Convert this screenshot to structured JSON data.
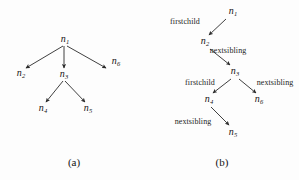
{
  "figure": {
    "background_color": "#fdfdfd",
    "stroke_color": "#2a2a2a",
    "text_color": "#141414"
  },
  "panel_a": {
    "caption": "(a)",
    "caption_pos": {
      "x": 74,
      "y": 162
    },
    "nodes": [
      {
        "id": "a-n1",
        "name": "n",
        "sub": "1",
        "x": 65,
        "y": 40
      },
      {
        "id": "a-n2",
        "name": "n",
        "sub": "2",
        "x": 21,
        "y": 74
      },
      {
        "id": "a-n3",
        "name": "n",
        "sub": "3",
        "x": 64,
        "y": 75
      },
      {
        "id": "a-n6",
        "name": "n",
        "sub": "6",
        "x": 116,
        "y": 62
      },
      {
        "id": "a-n4",
        "name": "n",
        "sub": "4",
        "x": 43,
        "y": 109
      },
      {
        "id": "a-n5",
        "name": "n",
        "sub": "5",
        "x": 88,
        "y": 109
      }
    ],
    "edges": [
      {
        "id": "a-e1",
        "from": "a-n1",
        "to": "a-n2",
        "x1": 63,
        "y1": 46,
        "x2": 26,
        "y2": 68
      },
      {
        "id": "a-e2",
        "from": "a-n1",
        "to": "a-n3",
        "x1": 64,
        "y1": 46,
        "x2": 64,
        "y2": 68
      },
      {
        "id": "a-e3",
        "from": "a-n1",
        "to": "a-n6",
        "x1": 67,
        "y1": 46,
        "x2": 106,
        "y2": 68
      },
      {
        "id": "a-e4",
        "from": "a-n3",
        "to": "a-n4",
        "x1": 63,
        "y1": 81,
        "x2": 46,
        "y2": 102
      },
      {
        "id": "a-e5",
        "from": "a-n3",
        "to": "a-n5",
        "x1": 65,
        "y1": 81,
        "x2": 85,
        "y2": 102
      }
    ]
  },
  "panel_b": {
    "caption": "(b)",
    "caption_pos": {
      "x": 222,
      "y": 162
    },
    "nodes": [
      {
        "id": "b-n1",
        "name": "n",
        "sub": "1",
        "x": 233,
        "y": 12
      },
      {
        "id": "b-n2",
        "name": "n",
        "sub": "2",
        "x": 205,
        "y": 42
      },
      {
        "id": "b-n3",
        "name": "n",
        "sub": "3",
        "x": 235,
        "y": 72
      },
      {
        "id": "b-n4",
        "name": "n",
        "sub": "4",
        "x": 209,
        "y": 100
      },
      {
        "id": "b-n6",
        "name": "n",
        "sub": "6",
        "x": 259,
        "y": 100
      },
      {
        "id": "b-n5",
        "name": "n",
        "sub": "5",
        "x": 233,
        "y": 133
      }
    ],
    "edges": [
      {
        "id": "b-e1",
        "from": "b-n1",
        "to": "b-n2",
        "label": "firstchild",
        "label_x": 185,
        "label_y": 22,
        "x1": 226,
        "y1": 19,
        "x2": 209,
        "y2": 35
      },
      {
        "id": "b-e2",
        "from": "b-n2",
        "to": "b-n3",
        "label": "nextsibling",
        "label_x": 228,
        "label_y": 51,
        "x1": 210,
        "y1": 49,
        "x2": 230,
        "y2": 65
      },
      {
        "id": "b-e3",
        "from": "b-n3",
        "to": "b-n4",
        "label": "firstchild",
        "label_x": 200,
        "label_y": 83,
        "x1": 231,
        "y1": 79,
        "x2": 213,
        "y2": 93
      },
      {
        "id": "b-e4",
        "from": "b-n3",
        "to": "b-n6",
        "label": "nextsibling",
        "label_x": 275,
        "label_y": 83,
        "x1": 239,
        "y1": 79,
        "x2": 256,
        "y2": 93
      },
      {
        "id": "b-e5",
        "from": "b-n4",
        "to": "b-n5",
        "label": "nextsibling",
        "label_x": 193,
        "label_y": 122,
        "x1": 211,
        "y1": 107,
        "x2": 229,
        "y2": 125
      }
    ]
  }
}
